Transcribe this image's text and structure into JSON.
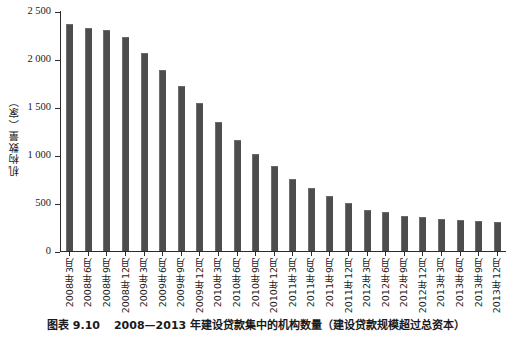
{
  "chart_data": {
    "type": "bar",
    "title": "",
    "xlabel": "",
    "ylabel": "机构数量（家）",
    "ylim": [
      0,
      2500
    ],
    "yticks": [
      0,
      500,
      1000,
      1500,
      2000,
      2500
    ],
    "ytick_labels": [
      "0",
      "500",
      "1 000",
      "1 500",
      "2 000",
      "2 500"
    ],
    "grid": false,
    "legend": "none",
    "bar_color": "#4d4d4d",
    "categories": [
      "2008年3月",
      "2008年6月",
      "2008年9月",
      "2008年12月",
      "2009年3月",
      "2009年6月",
      "2009年9月",
      "2009年12月",
      "2010年3月",
      "2010年6月",
      "2010年9月",
      "2010年12月",
      "2011年3月",
      "2011年6月",
      "2011年9月",
      "2011年12月",
      "2012年3月",
      "2012年6月",
      "2012年9月",
      "2012年12月",
      "2013年3月",
      "2013年6月",
      "2013年9月",
      "2013年12月"
    ],
    "values": [
      2350,
      2310,
      2290,
      2220,
      2050,
      1870,
      1710,
      1530,
      1330,
      1150,
      1000,
      870,
      740,
      650,
      560,
      490,
      420,
      400,
      355,
      340,
      320,
      310,
      300,
      290
    ]
  },
  "caption": {
    "label": "图表 9.10",
    "text": "2008—2013 年建设贷款集中的机构数量（建设贷款规模超过总资本）"
  }
}
